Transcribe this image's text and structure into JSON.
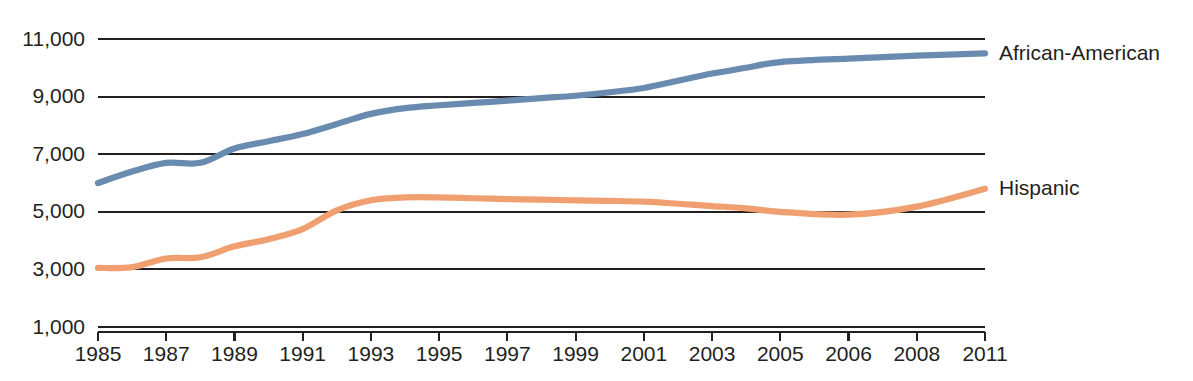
{
  "chart_data": {
    "type": "line",
    "title": "",
    "subtitle": "",
    "xlabel": "",
    "ylabel": "",
    "grid": true,
    "legend_position": "right-inline-end-of-line",
    "xlim": [
      1985,
      2011
    ],
    "ylim": [
      1000,
      11000
    ],
    "y_ticks": [
      11000,
      9000,
      7000,
      5000,
      3000,
      1000
    ],
    "y_tick_labels": [
      "11,000",
      "9,000",
      "7,000",
      "5,000",
      "3,000",
      "1,000"
    ],
    "x_ticks": [
      1985,
      1987,
      1989,
      1991,
      1993,
      1995,
      1997,
      1999,
      2001,
      2003,
      2005,
      2006,
      2008,
      2011
    ],
    "x_tick_labels": [
      "1985",
      "1987",
      "1989",
      "1991",
      "1993",
      "1995",
      "1997",
      "1999",
      "2001",
      "2003",
      "2005",
      "2006",
      "2008",
      "2011"
    ],
    "x_axis_note": "Tick positions are evenly spaced on screen even though year gaps are unequal after 2005.",
    "categories": [
      1985,
      1986,
      1987,
      1988,
      1989,
      1990,
      1991,
      1992,
      1993,
      1994,
      1995,
      1996,
      1997,
      1998,
      1999,
      2000,
      2001,
      2002,
      2003,
      2004,
      2005,
      2006,
      2008,
      2011
    ],
    "series": [
      {
        "name": "African-American",
        "color": "#6a8bb0",
        "label": "African-American",
        "values": [
          6000,
          6400,
          6700,
          6700,
          7200,
          7450,
          7700,
          8050,
          8400,
          8600,
          8700,
          8780,
          8860,
          8950,
          9030,
          9150,
          9300,
          9550,
          9800,
          10000,
          10200,
          10320,
          10420,
          10500
        ]
      },
      {
        "name": "Hispanic",
        "color": "#f0a070",
        "label": "Hispanic",
        "values": [
          3050,
          3080,
          3380,
          3420,
          3800,
          4050,
          4400,
          5050,
          5400,
          5500,
          5500,
          5470,
          5440,
          5420,
          5400,
          5380,
          5350,
          5280,
          5200,
          5120,
          5000,
          4900,
          5180,
          5800
        ]
      }
    ]
  },
  "axis": {
    "y_label_color": "#231f20",
    "x_label_color": "#231f20",
    "gridline_color": "#231f20"
  }
}
